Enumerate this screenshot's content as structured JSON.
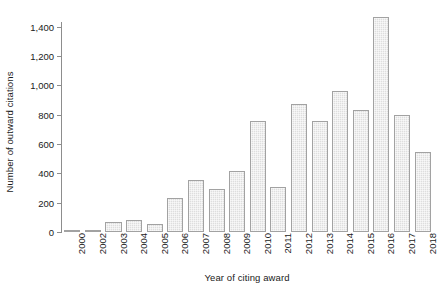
{
  "chart_data": {
    "type": "bar",
    "title": "",
    "xlabel": "Year of citing award",
    "ylabel": "Number of outward citations",
    "categories": [
      "2000",
      "2002",
      "2003",
      "2004",
      "2005",
      "2006",
      "2007",
      "2008",
      "2009",
      "2010",
      "2011",
      "2012",
      "2013",
      "2014",
      "2015",
      "2016",
      "2017",
      "2018"
    ],
    "values": [
      10,
      15,
      70,
      80,
      55,
      235,
      355,
      290,
      415,
      760,
      305,
      870,
      755,
      960,
      835,
      1465,
      795,
      545
    ],
    "series": [
      {
        "name": "Outward citations",
        "values": [
          10,
          15,
          70,
          80,
          55,
          235,
          355,
          290,
          415,
          760,
          305,
          870,
          755,
          960,
          835,
          1465,
          795,
          545
        ]
      }
    ],
    "ylim": [
      0,
      1500
    ],
    "yticks": [
      0,
      200,
      400,
      600,
      800,
      1000,
      1200,
      1400
    ],
    "ytick_labels": [
      "0",
      "200",
      "400",
      "600",
      "800",
      "1,000",
      "1,200",
      "1,400"
    ],
    "grid": false,
    "legend": false,
    "legend_position": "none",
    "bar_fill_color": "#dedede",
    "bar_edge_color": "#a2a2a2",
    "axis_color": "#8d8d8d",
    "background_color": "#ffffff",
    "xtick_rotation": -90
  }
}
